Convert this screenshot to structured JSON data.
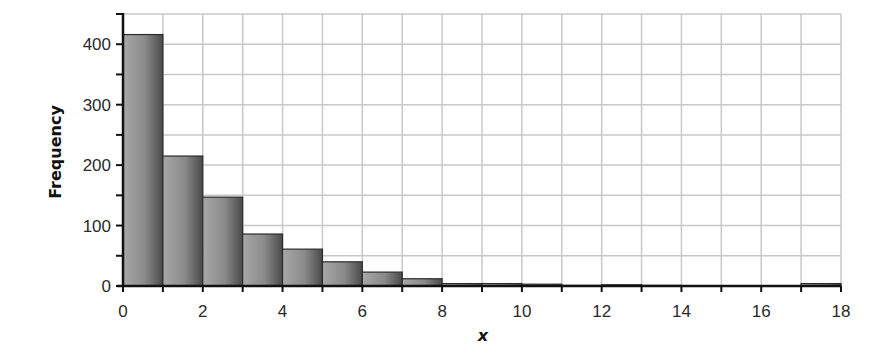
{
  "chart_data": {
    "type": "bar",
    "subtype": "histogram",
    "title": "",
    "xlabel": "x",
    "ylabel": "Frequency",
    "xlim": [
      0,
      18
    ],
    "ylim": [
      0,
      450
    ],
    "bin_width": 1,
    "bin_edges": [
      0,
      1,
      2,
      3,
      4,
      5,
      6,
      7,
      8,
      9,
      10,
      11,
      12,
      13,
      14,
      15,
      16,
      17,
      18
    ],
    "categories": [
      "0-1",
      "1-2",
      "2-3",
      "3-4",
      "4-5",
      "5-6",
      "6-7",
      "7-8",
      "8-9",
      "9-10",
      "10-11",
      "11-12",
      "12-13",
      "13-14",
      "14-15",
      "15-16",
      "16-17",
      "17-18"
    ],
    "values": [
      416,
      215,
      147,
      86,
      61,
      40,
      23,
      12,
      4,
      4,
      3,
      1,
      2,
      1,
      0,
      0,
      0,
      4
    ],
    "x_ticks": [
      0,
      2,
      4,
      6,
      8,
      10,
      12,
      14,
      16,
      18
    ],
    "y_ticks": [
      0,
      100,
      200,
      300,
      400
    ],
    "y_minor_ticks": [
      50,
      150,
      250,
      350,
      450
    ],
    "grid": true,
    "grid_x_step": 1,
    "grid_y_step": 50,
    "legend": null
  },
  "colors": {
    "bar_light": "#a8a8a8",
    "bar_dark": "#4a4a4a",
    "bar_edge": "#2b2b2b",
    "grid": "#c8c8c8",
    "axis": "#111111",
    "text": "#2a2a2a"
  }
}
